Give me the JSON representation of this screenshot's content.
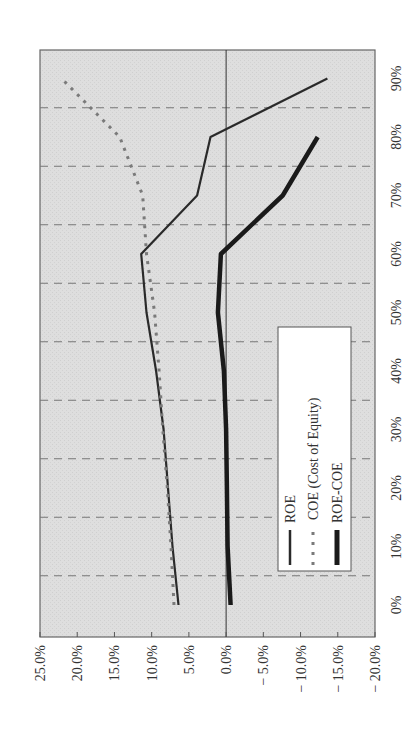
{
  "chart_data": {
    "type": "line",
    "orientation": "rotated-90-ccw",
    "title": "",
    "xlabel": "",
    "ylabel": "",
    "categories": [
      "0%",
      "10%",
      "20%",
      "30%",
      "40%",
      "50%",
      "60%",
      "70%",
      "80%",
      "90%"
    ],
    "ylim": [
      -20,
      25
    ],
    "yticks": [
      "25.0%",
      "20.0%",
      "15.0%",
      "10.0%",
      "5.0%",
      "0.0%",
      "− 5.0%",
      "− 10.0%",
      "− 15.0%",
      "− 20.0%"
    ],
    "ytick_values": [
      25,
      20,
      15,
      10,
      5,
      0,
      -5,
      -10,
      -15,
      -20
    ],
    "grid": "dashed gridlines between categories",
    "legend_position": "inside, lower-right",
    "series": [
      {
        "name": "ROE",
        "style": "solid-thin",
        "values": [
          6.4,
          7.2,
          7.8,
          8.4,
          9.4,
          10.7,
          11.4,
          3.9,
          2.1,
          -13.6
        ]
      },
      {
        "name": "COE (Cost of Equity)",
        "style": "dotted-gray",
        "values": [
          7.0,
          7.4,
          7.9,
          8.5,
          9.0,
          9.6,
          10.7,
          11.2,
          14.3,
          22.1
        ]
      },
      {
        "name": "ROE-COE",
        "style": "solid-thick",
        "values": [
          -0.6,
          -0.2,
          -0.1,
          0.0,
          0.3,
          1.1,
          0.7,
          -7.6,
          -12.3,
          null
        ]
      }
    ]
  },
  "legend": {
    "items": [
      "ROE",
      "COE (Cost of Equity)",
      "ROE-COE"
    ]
  },
  "colors": {
    "plot_bg": "#dcdcdc",
    "roe": "#2a2a2a",
    "coe": "#7a7a7a",
    "roe_coe": "#1a1a1a",
    "grid": "#777777"
  }
}
